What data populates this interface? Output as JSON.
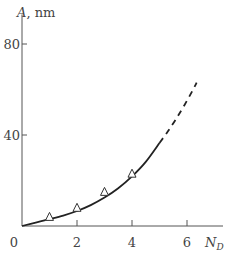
{
  "chart_data": {
    "type": "line",
    "title": "",
    "xlabel": "N",
    "xlabel_subscript": "D",
    "ylabel": "A",
    "ylabel_unit": ", nm",
    "xlim": [
      0,
      7.5
    ],
    "ylim": [
      0,
      93
    ],
    "x_ticks": [
      0,
      2,
      4,
      6
    ],
    "x_tick_labels": [
      "0",
      "2",
      "4",
      "6"
    ],
    "y_ticks": [
      40,
      80
    ],
    "y_tick_labels": [
      "40",
      "80"
    ],
    "grid": false,
    "series": [
      {
        "name": "measured",
        "style": "markers",
        "marker": "open-triangle",
        "x": [
          1,
          2,
          3,
          4
        ],
        "y": [
          4,
          8,
          15,
          23
        ]
      },
      {
        "name": "fit",
        "style": "solid-line",
        "x": [
          0,
          0.5,
          1,
          1.5,
          2,
          2.5,
          3,
          3.5,
          4,
          4.5,
          5
        ],
        "y": [
          0,
          1.5,
          3.0,
          4.6,
          6.6,
          9.2,
          12.5,
          16.6,
          21.8,
          28.2,
          36.5
        ]
      },
      {
        "name": "extrapolation",
        "style": "dashed-line",
        "x": [
          5,
          5.3,
          5.6,
          5.9,
          6.2,
          6.35
        ],
        "y": [
          36.5,
          41.5,
          47.0,
          53.0,
          59.5,
          63.0
        ]
      }
    ]
  }
}
